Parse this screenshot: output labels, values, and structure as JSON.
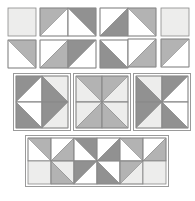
{
  "diagram": {
    "type": "quilt-block-construction",
    "canvas": {
      "width": 195,
      "height": 201,
      "background": "#ffffff"
    },
    "palette": {
      "light": "#ededec",
      "medium": "#b3b3b3",
      "dark": "#919191",
      "white": "#ffffff",
      "outline": "#8a8a8a",
      "frame": "#9a9a9a"
    },
    "legend": {
      "light_label": "light value",
      "medium_label": "medium value",
      "dark_label": "dark value",
      "white_label": "background"
    },
    "unit_note": "half-square triangle units",
    "groups": [
      {
        "id": "group-top-left",
        "name": "two-by-two unit pair group",
        "x": 8,
        "y": 8,
        "cell": 28,
        "cols": 2,
        "rows": 2,
        "gap": 4,
        "cells": [
          {
            "r": 0,
            "c": 0,
            "kind": "solid",
            "fill": "light"
          },
          {
            "r": 0,
            "c": 1,
            "kind": "hst",
            "orient": "tl-br",
            "a": "medium",
            "b": "white"
          },
          {
            "r": 1,
            "c": 0,
            "kind": "hst",
            "orient": "tr-bl",
            "a": "medium",
            "b": "white"
          },
          {
            "r": 1,
            "c": 1,
            "kind": "hst",
            "orient": "tl-br",
            "a": "white",
            "b": "medium"
          }
        ]
      },
      {
        "id": "group-top-center",
        "name": "double chevron flying geese group",
        "x": 68,
        "y": 8,
        "cell": 28,
        "cols": 2,
        "rows": 2,
        "gap": 4,
        "cells": [
          {
            "r": 0,
            "c": 0,
            "kind": "hst",
            "orient": "tr-bl",
            "a": "dark",
            "b": "white"
          },
          {
            "r": 0,
            "c": 1,
            "kind": "hst",
            "orient": "tl-br",
            "a": "white",
            "b": "dark"
          },
          {
            "r": 1,
            "c": 0,
            "kind": "hst",
            "orient": "tl-br",
            "a": "dark",
            "b": "white"
          },
          {
            "r": 1,
            "c": 1,
            "kind": "hst",
            "orient": "tr-bl",
            "a": "white",
            "b": "dark"
          }
        ]
      },
      {
        "id": "group-top-right-a",
        "name": "left point column group",
        "x": 128,
        "y": 8,
        "cell": 28,
        "cols": 1,
        "rows": 2,
        "gap": 3,
        "cells": [
          {
            "r": 0,
            "c": 0,
            "kind": "hst",
            "orient": "tr-bl",
            "a": "medium",
            "b": "white"
          },
          {
            "r": 1,
            "c": 0,
            "kind": "hst",
            "orient": "tl-br",
            "a": "white",
            "b": "medium"
          }
        ]
      },
      {
        "id": "group-top-right-b",
        "name": "light half column group",
        "x": 161,
        "y": 8,
        "cell": 28,
        "cols": 1,
        "rows": 2,
        "gap": 3,
        "cells": [
          {
            "r": 0,
            "c": 0,
            "kind": "solid",
            "fill": "light"
          },
          {
            "r": 1,
            "c": 0,
            "kind": "hst",
            "orient": "tl-br",
            "a": "medium",
            "b": "white"
          }
        ]
      },
      {
        "id": "group-mid-left",
        "name": "right facing arrow block",
        "x": 16,
        "y": 76,
        "cell": 26,
        "cols": 2,
        "rows": 2,
        "gap": 0,
        "cells": [
          {
            "r": 0,
            "c": 0,
            "kind": "hst",
            "orient": "tl-br",
            "a": "dark",
            "b": "white"
          },
          {
            "r": 0,
            "c": 1,
            "kind": "hst",
            "orient": "tr-bl",
            "a": "light",
            "b": "dark"
          },
          {
            "r": 1,
            "c": 0,
            "kind": "hst",
            "orient": "tr-bl",
            "a": "white",
            "b": "dark"
          },
          {
            "r": 1,
            "c": 1,
            "kind": "hst",
            "orient": "tl-br",
            "a": "dark",
            "b": "light"
          }
        ]
      },
      {
        "id": "group-mid-center",
        "name": "square in a square block",
        "x": 76,
        "y": 76,
        "cell": 26,
        "cols": 2,
        "rows": 2,
        "gap": 0,
        "cells": [
          {
            "r": 0,
            "c": 0,
            "kind": "hst",
            "orient": "tr-bl",
            "a": "medium",
            "b": "light"
          },
          {
            "r": 0,
            "c": 1,
            "kind": "hst",
            "orient": "tl-br",
            "a": "medium",
            "b": "light"
          },
          {
            "r": 1,
            "c": 0,
            "kind": "hst",
            "orient": "tl-br",
            "a": "light",
            "b": "medium"
          },
          {
            "r": 1,
            "c": 1,
            "kind": "hst",
            "orient": "tr-bl",
            "a": "light",
            "b": "medium"
          }
        ]
      },
      {
        "id": "group-mid-right",
        "name": "left facing arrow block",
        "x": 136,
        "y": 76,
        "cell": 26,
        "cols": 2,
        "rows": 2,
        "gap": 0,
        "cells": [
          {
            "r": 0,
            "c": 0,
            "kind": "hst",
            "orient": "tr-bl",
            "a": "light",
            "b": "dark"
          },
          {
            "r": 0,
            "c": 1,
            "kind": "hst",
            "orient": "tl-br",
            "a": "dark",
            "b": "white"
          },
          {
            "r": 1,
            "c": 0,
            "kind": "hst",
            "orient": "tl-br",
            "a": "dark",
            "b": "light"
          },
          {
            "r": 1,
            "c": 1,
            "kind": "hst",
            "orient": "tr-bl",
            "a": "white",
            "b": "dark"
          }
        ]
      },
      {
        "id": "group-bottom-row",
        "name": "assembled border row",
        "x": 28,
        "y": 138,
        "cell": 23,
        "cols": 6,
        "rows": 2,
        "gap": 0,
        "cells": [
          {
            "r": 0,
            "c": 0,
            "kind": "hst",
            "orient": "tr-bl",
            "a": "medium",
            "b": "white"
          },
          {
            "r": 0,
            "c": 1,
            "kind": "hst",
            "orient": "tl-br",
            "a": "white",
            "b": "medium"
          },
          {
            "r": 0,
            "c": 2,
            "kind": "hst",
            "orient": "tr-bl",
            "a": "dark",
            "b": "white"
          },
          {
            "r": 0,
            "c": 3,
            "kind": "hst",
            "orient": "tl-br",
            "a": "white",
            "b": "dark"
          },
          {
            "r": 0,
            "c": 4,
            "kind": "hst",
            "orient": "tr-bl",
            "a": "medium",
            "b": "white"
          },
          {
            "r": 0,
            "c": 5,
            "kind": "hst",
            "orient": "tl-br",
            "a": "white",
            "b": "medium"
          },
          {
            "r": 1,
            "c": 0,
            "kind": "solid",
            "fill": "light"
          },
          {
            "r": 1,
            "c": 1,
            "kind": "hst",
            "orient": "tr-bl",
            "a": "light",
            "b": "medium"
          },
          {
            "r": 1,
            "c": 2,
            "kind": "hst",
            "orient": "tl-br",
            "a": "dark",
            "b": "white"
          },
          {
            "r": 1,
            "c": 3,
            "kind": "hst",
            "orient": "tr-bl",
            "a": "white",
            "b": "dark"
          },
          {
            "r": 1,
            "c": 4,
            "kind": "hst",
            "orient": "tl-br",
            "a": "medium",
            "b": "light"
          },
          {
            "r": 1,
            "c": 5,
            "kind": "solid",
            "fill": "light"
          }
        ]
      }
    ]
  }
}
